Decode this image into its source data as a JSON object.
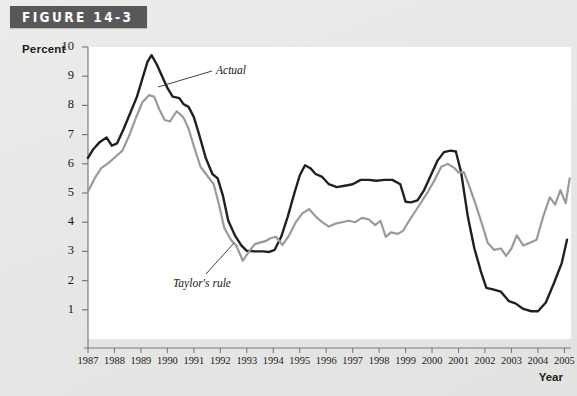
{
  "figure": {
    "banner_label": "FIGURE 14-3"
  },
  "axes": {
    "y_axis_title": "Percent",
    "x_axis_title": "Year",
    "y_ticks": [
      "10",
      "9",
      "8",
      "7",
      "6",
      "5",
      "4",
      "3",
      "2",
      "1"
    ],
    "x_ticks": [
      "1987",
      "1988",
      "1989",
      "1990",
      "1991",
      "1992",
      "1993",
      "1994",
      "1995",
      "1996",
      "1997",
      "1998",
      "1999",
      "2000",
      "2001",
      "2002",
      "2003",
      "2004",
      "2005"
    ]
  },
  "annotations": {
    "actual": "Actual",
    "taylor": "Taylor's rule"
  },
  "colors": {
    "actual_line": "#231f20",
    "taylor_line": "#9a9a9a",
    "banner_bg": "#58585a",
    "banner_text": "#ffffff",
    "plot_bg": "#ffffff",
    "page_bg": "#e8e8e6",
    "axis": "#7b7b7b"
  },
  "chart_data": {
    "type": "line",
    "title": "FIGURE 14-3",
    "xlabel": "Year",
    "ylabel": "Percent",
    "xlim": [
      1987,
      2005.25
    ],
    "ylim": [
      0,
      10
    ],
    "grid": false,
    "legend": "inline-annotations",
    "categories": [
      "1987",
      "1988",
      "1989",
      "1990",
      "1991",
      "1992",
      "1993",
      "1994",
      "1995",
      "1996",
      "1997",
      "1998",
      "1999",
      "2000",
      "2001",
      "2002",
      "2003",
      "2004",
      "2005"
    ],
    "series": [
      {
        "name": "Actual",
        "color": "#231f20",
        "x": [
          1987.0,
          1987.2,
          1987.45,
          1987.7,
          1987.9,
          1988.1,
          1988.35,
          1988.6,
          1988.85,
          1989.05,
          1989.25,
          1989.4,
          1989.6,
          1989.8,
          1990.0,
          1990.2,
          1990.45,
          1990.6,
          1990.8,
          1991.0,
          1991.2,
          1991.45,
          1991.7,
          1991.9,
          1992.1,
          1992.3,
          1992.55,
          1992.8,
          1993.0,
          1993.3,
          1993.6,
          1993.85,
          1994.05,
          1994.3,
          1994.55,
          1994.8,
          1995.0,
          1995.2,
          1995.4,
          1995.6,
          1995.85,
          1996.1,
          1996.4,
          1996.7,
          1997.0,
          1997.3,
          1997.6,
          1997.9,
          1998.2,
          1998.5,
          1998.8,
          1999.0,
          1999.2,
          1999.45,
          1999.7,
          1999.95,
          2000.2,
          2000.45,
          2000.7,
          2000.9,
          2001.1,
          2001.35,
          2001.6,
          2001.85,
          2002.05,
          2002.3,
          2002.6,
          2002.9,
          2003.15,
          2003.45,
          2003.75,
          2004.0,
          2004.3,
          2004.6,
          2004.9,
          2005.1
        ],
        "y": [
          6.2,
          6.5,
          6.75,
          6.9,
          6.62,
          6.7,
          7.2,
          7.75,
          8.3,
          8.9,
          9.5,
          9.72,
          9.4,
          9.0,
          8.6,
          8.3,
          8.25,
          8.05,
          7.95,
          7.6,
          7.0,
          6.2,
          5.65,
          5.5,
          4.9,
          4.05,
          3.55,
          3.2,
          3.02,
          3.0,
          3.0,
          2.98,
          3.05,
          3.5,
          4.2,
          5.0,
          5.6,
          5.95,
          5.85,
          5.65,
          5.55,
          5.3,
          5.2,
          5.25,
          5.3,
          5.45,
          5.45,
          5.42,
          5.45,
          5.45,
          5.3,
          4.7,
          4.68,
          4.75,
          5.1,
          5.6,
          6.1,
          6.4,
          6.45,
          6.42,
          5.7,
          4.2,
          3.1,
          2.3,
          1.75,
          1.7,
          1.62,
          1.3,
          1.22,
          1.03,
          0.95,
          0.95,
          1.25,
          1.9,
          2.6,
          3.4
        ]
      },
      {
        "name": "Taylor's rule",
        "color": "#9a9a9a",
        "x": [
          1987.0,
          1987.25,
          1987.5,
          1987.8,
          1988.05,
          1988.3,
          1988.55,
          1988.8,
          1989.05,
          1989.3,
          1989.5,
          1989.7,
          1989.9,
          1990.1,
          1990.35,
          1990.6,
          1990.8,
          1991.0,
          1991.25,
          1991.5,
          1991.75,
          1991.95,
          1992.15,
          1992.4,
          1992.6,
          1992.85,
          1993.05,
          1993.3,
          1993.5,
          1993.7,
          1993.9,
          1994.1,
          1994.35,
          1994.6,
          1994.85,
          1995.1,
          1995.35,
          1995.6,
          1995.85,
          1996.1,
          1996.35,
          1996.6,
          1996.85,
          1997.1,
          1997.35,
          1997.6,
          1997.85,
          1998.05,
          1998.25,
          1998.45,
          1998.7,
          1998.9,
          1999.1,
          1999.35,
          1999.6,
          1999.85,
          2000.1,
          2000.35,
          2000.6,
          2000.85,
          2001.0,
          2001.2,
          2001.4,
          2001.65,
          2001.9,
          2002.1,
          2002.35,
          2002.6,
          2002.8,
          2003.0,
          2003.2,
          2003.45,
          2003.7,
          2003.95,
          2004.2,
          2004.45,
          2004.65,
          2004.85,
          2005.05,
          2005.2
        ],
        "y": [
          5.05,
          5.5,
          5.85,
          6.05,
          6.25,
          6.45,
          6.95,
          7.55,
          8.1,
          8.35,
          8.3,
          7.85,
          7.5,
          7.45,
          7.8,
          7.6,
          7.2,
          6.6,
          5.9,
          5.6,
          5.3,
          4.6,
          3.8,
          3.4,
          3.2,
          2.68,
          2.95,
          3.25,
          3.3,
          3.35,
          3.45,
          3.5,
          3.22,
          3.55,
          4.0,
          4.3,
          4.45,
          4.2,
          4.0,
          3.85,
          3.95,
          4.0,
          4.05,
          4.0,
          4.15,
          4.1,
          3.9,
          4.05,
          3.5,
          3.65,
          3.6,
          3.7,
          4.0,
          4.35,
          4.7,
          5.05,
          5.45,
          5.9,
          6.0,
          5.85,
          5.7,
          5.72,
          5.25,
          4.6,
          3.9,
          3.3,
          3.05,
          3.1,
          2.85,
          3.1,
          3.55,
          3.2,
          3.3,
          3.4,
          4.2,
          4.85,
          4.6,
          5.1,
          4.65,
          5.5
        ]
      }
    ]
  }
}
